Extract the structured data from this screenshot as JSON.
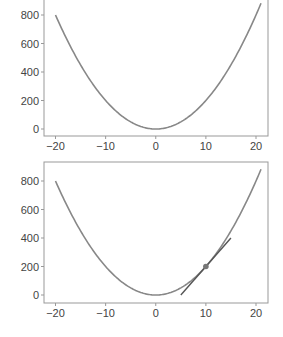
{
  "chart_data": [
    {
      "type": "line",
      "title": "",
      "xlabel": "",
      "ylabel": "",
      "xlim": [
        -22,
        22
      ],
      "ylim": [
        -30,
        900
      ],
      "xticks": [
        -20,
        -10,
        0,
        10,
        20
      ],
      "yticks": [
        0,
        200,
        400,
        600,
        800
      ],
      "xtick_labels": [
        "−20",
        "−10",
        "0",
        "10",
        "20"
      ],
      "ytick_labels": [
        "0",
        "200",
        "400",
        "600",
        "800"
      ],
      "grid": false,
      "series": [
        {
          "name": "f(x) = 2x^2",
          "x": [
            -20,
            -15,
            -10,
            -5,
            0,
            5,
            10,
            15,
            20,
            21
          ],
          "y": [
            800,
            450,
            200,
            50,
            0,
            50,
            200,
            450,
            800,
            882
          ],
          "color": "#888888"
        }
      ]
    },
    {
      "type": "line",
      "title": "",
      "xlabel": "",
      "ylabel": "",
      "xlim": [
        -22,
        22
      ],
      "ylim": [
        -30,
        900
      ],
      "xticks": [
        -20,
        -10,
        0,
        10,
        20
      ],
      "yticks": [
        0,
        200,
        400,
        600,
        800
      ],
      "xtick_labels": [
        "−20",
        "−10",
        "0",
        "10",
        "20"
      ],
      "ytick_labels": [
        "0",
        "200",
        "400",
        "600",
        "800"
      ],
      "grid": false,
      "series": [
        {
          "name": "f(x) = 2x^2",
          "x": [
            -20,
            -15,
            -10,
            -5,
            0,
            5,
            10,
            15,
            20,
            21
          ],
          "y": [
            800,
            450,
            200,
            50,
            0,
            50,
            200,
            450,
            800,
            882
          ],
          "color": "#888888"
        },
        {
          "name": "tangent at x=10",
          "x": [
            5,
            15
          ],
          "y": [
            0,
            400
          ],
          "color": "#555555"
        }
      ],
      "annotations": [
        {
          "type": "point",
          "x": 10,
          "y": 200,
          "label": "tangent point"
        }
      ]
    }
  ]
}
